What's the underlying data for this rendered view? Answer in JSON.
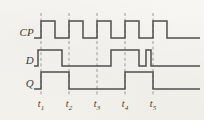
{
  "figure": {
    "type": "digital-timing-diagram",
    "width": 204,
    "height": 120,
    "background_color": "#f6f5f1",
    "trace_color": "#4f4f4f",
    "guide_color": "#9a9a9a",
    "text_color": "#3a3a3a"
  },
  "signals": [
    {
      "id": "cp",
      "label": "CP",
      "row_index": 0
    },
    {
      "id": "d",
      "label": "D",
      "row_index": 1
    },
    {
      "id": "q",
      "label": "Q",
      "row_index": 2
    }
  ],
  "time_markers": [
    {
      "id": "t1",
      "label": "t",
      "subscript": "1",
      "x": 41
    },
    {
      "id": "t2",
      "label": "t",
      "subscript": "2",
      "x": 69
    },
    {
      "id": "t3",
      "label": "t",
      "subscript": "3",
      "x": 97
    },
    {
      "id": "t4",
      "label": "t",
      "subscript": "4",
      "x": 125
    },
    {
      "id": "t5",
      "label": "t",
      "subscript": "5",
      "x": 153
    }
  ],
  "chart_data": {
    "type": "line",
    "title": "",
    "xlabel": "",
    "ylabel": "",
    "grid": false,
    "x_range": [
      34,
      200
    ],
    "marker_line_top": 13,
    "marker_line_bottom": 96,
    "rows": [
      {
        "name": "CP",
        "y_low": 38,
        "y_high": 21,
        "points": [
          [
            34,
            0
          ],
          [
            41,
            0
          ],
          [
            41,
            1
          ],
          [
            55,
            1
          ],
          [
            55,
            0
          ],
          [
            69,
            0
          ],
          [
            69,
            1
          ],
          [
            83,
            1
          ],
          [
            83,
            0
          ],
          [
            97,
            0
          ],
          [
            97,
            1
          ],
          [
            111,
            1
          ],
          [
            111,
            0
          ],
          [
            125,
            0
          ],
          [
            125,
            1
          ],
          [
            139,
            1
          ],
          [
            139,
            0
          ],
          [
            153,
            0
          ],
          [
            153,
            1
          ],
          [
            167,
            1
          ],
          [
            167,
            0
          ],
          [
            200,
            0
          ]
        ]
      },
      {
        "name": "D",
        "y_low": 66,
        "y_high": 50,
        "points": [
          [
            34,
            0
          ],
          [
            38,
            0
          ],
          [
            38,
            1
          ],
          [
            62,
            1
          ],
          [
            62,
            0
          ],
          [
            111,
            0
          ],
          [
            111,
            1
          ],
          [
            139,
            1
          ],
          [
            139,
            0
          ],
          [
            146,
            0
          ],
          [
            146,
            1
          ],
          [
            151,
            1
          ],
          [
            151,
            0
          ],
          [
            200,
            0
          ]
        ]
      },
      {
        "name": "Q",
        "y_low": 89,
        "y_high": 72,
        "points": [
          [
            34,
            0
          ],
          [
            41,
            0
          ],
          [
            41,
            1
          ],
          [
            69,
            1
          ],
          [
            69,
            0
          ],
          [
            125,
            0
          ],
          [
            125,
            1
          ],
          [
            153,
            1
          ],
          [
            153,
            0
          ],
          [
            200,
            0
          ]
        ]
      }
    ]
  }
}
